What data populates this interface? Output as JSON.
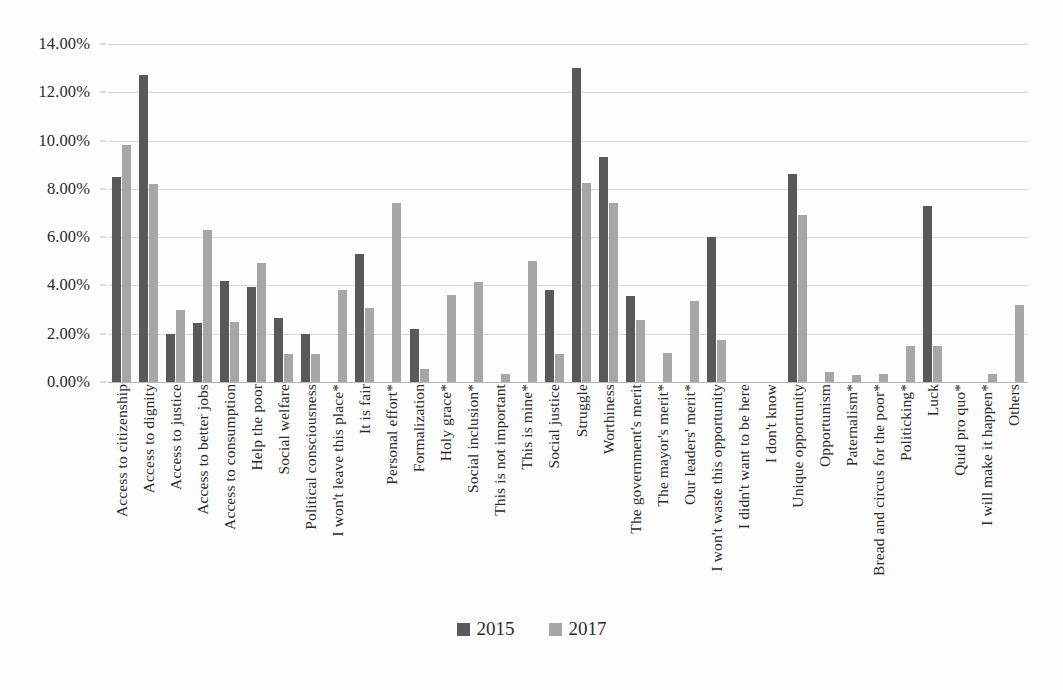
{
  "chart_data": {
    "type": "bar",
    "title": "",
    "subtitle": "",
    "xlabel": "",
    "ylabel": "",
    "ylim": [
      0,
      14
    ],
    "yticks": [
      "0.00%",
      "2.00%",
      "4.00%",
      "6.00%",
      "8.00%",
      "10.00%",
      "12.00%",
      "14.00%"
    ],
    "ytick_values": [
      0,
      2,
      4,
      6,
      8,
      10,
      12,
      14
    ],
    "grid": true,
    "legend_position": "bottom",
    "value_format": "percent",
    "colors": {
      "series_2015": "#595959",
      "series_2017": "#a6a6a6",
      "gridline": "#d9d9d9",
      "text": "#2b2b2b"
    },
    "categories": [
      "Access to citizenship",
      "Access to dignity",
      "Access to justice",
      "Access to better jobs",
      "Access to consumption",
      "Help the poor",
      "Social welfare",
      "Political consciousness",
      "I won't leave this place*",
      "It is fair",
      "Personal effort*",
      "Formalization",
      "Holy grace*",
      "Social inclusion*",
      "This is not important",
      "This is mine*",
      "Social justice",
      "Struggle",
      "Worthiness",
      "The government's merit",
      "The mayor's merit*",
      "Our leaders' merit*",
      "I won't waste this opportunity",
      "I didn't want to be here",
      "I don't know",
      "Unique opportunity",
      "Opportunism",
      "Paternalism*",
      "Bread and circus for the poor*",
      "Politicking*",
      "Luck",
      "Quid pro quo*",
      "I will make it happen*",
      "Others"
    ],
    "series": [
      {
        "name": "2015",
        "color": "#595959",
        "values": [
          8.5,
          12.7,
          2.0,
          2.45,
          4.2,
          3.95,
          2.65,
          2.0,
          0,
          5.3,
          0,
          2.2,
          0,
          0,
          0,
          0,
          3.8,
          13.0,
          9.3,
          3.55,
          0,
          0,
          6.0,
          0,
          0,
          8.6,
          0,
          0,
          0,
          0,
          7.3,
          0,
          0,
          0
        ]
      },
      {
        "name": "2017",
        "color": "#a6a6a6",
        "values": [
          9.8,
          8.2,
          3.0,
          6.3,
          2.5,
          4.95,
          1.15,
          1.15,
          3.8,
          3.05,
          7.4,
          0.55,
          3.6,
          4.15,
          0.35,
          5.0,
          1.15,
          8.25,
          7.4,
          2.55,
          1.2,
          3.35,
          1.75,
          0,
          0,
          6.9,
          0.4,
          0.3,
          0.35,
          1.5,
          1.5,
          0,
          0.35,
          3.2
        ]
      }
    ]
  },
  "legend": {
    "items": [
      {
        "label": "2015",
        "color": "#595959"
      },
      {
        "label": "2017",
        "color": "#a6a6a6"
      }
    ]
  }
}
